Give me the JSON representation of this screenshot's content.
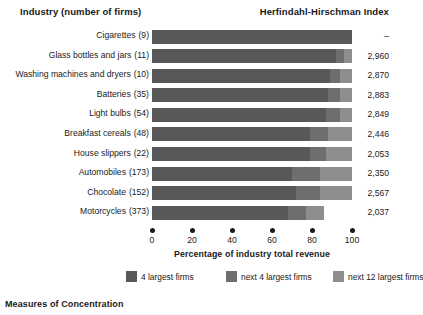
{
  "header": {
    "left_column_title": "Industry (number of firms)",
    "right_column_title": "Herfindahl-Hirschman Index"
  },
  "footer": {
    "note": "Measures of Concentration"
  },
  "axis": {
    "title": "Percentage of industry total revenue",
    "ticks": [
      "0",
      "20",
      "40",
      "60",
      "80",
      "100"
    ]
  },
  "legend": {
    "items": [
      {
        "label": "4 largest firms",
        "color": "#585858"
      },
      {
        "label": "next 4 largest firms",
        "color": "#6e6e6e"
      },
      {
        "label": "next 12 largest firms",
        "color": "#8e8e8e"
      }
    ]
  },
  "chart_data": {
    "type": "bar",
    "subtype": "stacked-horizontal",
    "title": "Measures of Concentration",
    "xlabel": "Percentage of industry total revenue",
    "ylabel": "Industry (number of firms)",
    "xlim": [
      0,
      100
    ],
    "grid": false,
    "legend_position": "bottom",
    "series": [
      {
        "name": "4 largest firms",
        "color": "#585858",
        "values": [
          100,
          92,
          89,
          88,
          87,
          79,
          79,
          70,
          72,
          68
        ]
      },
      {
        "name": "next 4 largest firms",
        "color": "#6e6e6e",
        "values": [
          0,
          4,
          5,
          6,
          7,
          9,
          8,
          14,
          12,
          9
        ]
      },
      {
        "name": "next 12 largest firms",
        "color": "#8e8e8e",
        "values": [
          0,
          4,
          6,
          6,
          6,
          12,
          13,
          16,
          16,
          9
        ]
      }
    ],
    "categories": [
      "Cigarettes",
      "Glass bottles and jars",
      "Washing machines and dryers",
      "Batteries",
      "Light bulbs",
      "Breakfast cereals",
      "House slippers",
      "Automobiles",
      "Chocolate",
      "Motorcycles"
    ],
    "rows": [
      {
        "industry": "Cigarettes",
        "firms": "(9)",
        "hhi": "–",
        "segments": [
          100,
          0,
          0
        ]
      },
      {
        "industry": "Glass bottles and jars",
        "firms": "(11)",
        "hhi": "2,960",
        "segments": [
          92,
          4,
          4
        ]
      },
      {
        "industry": "Washing machines and dryers",
        "firms": "(10)",
        "hhi": "2,870",
        "segments": [
          89,
          5,
          6
        ]
      },
      {
        "industry": "Batteries",
        "firms": "(35)",
        "hhi": "2,883",
        "segments": [
          88,
          6,
          6
        ]
      },
      {
        "industry": "Light bulbs",
        "firms": "(54)",
        "hhi": "2,849",
        "segments": [
          87,
          7,
          6
        ]
      },
      {
        "industry": "Breakfast cereals",
        "firms": "(48)",
        "hhi": "2,446",
        "segments": [
          79,
          9,
          12
        ]
      },
      {
        "industry": "House slippers",
        "firms": "(22)",
        "hhi": "2,053",
        "segments": [
          79,
          8,
          13
        ]
      },
      {
        "industry": "Automobiles",
        "firms": "(173)",
        "hhi": "2,350",
        "segments": [
          70,
          14,
          16
        ]
      },
      {
        "industry": "Chocolate",
        "firms": "(152)",
        "hhi": "2,567",
        "segments": [
          72,
          12,
          16
        ]
      },
      {
        "industry": "Motorcycles",
        "firms": "(373)",
        "hhi": "2,037",
        "segments": [
          68,
          9,
          9
        ]
      }
    ]
  }
}
